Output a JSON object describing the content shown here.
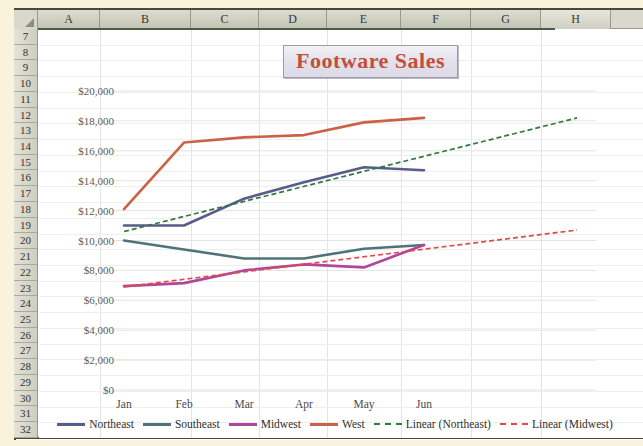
{
  "spreadsheet": {
    "columns": [
      "A",
      "B",
      "C",
      "D",
      "E",
      "F",
      "G",
      "H"
    ],
    "selected_columns": [
      "A",
      "B",
      "C",
      "D",
      "E",
      "F",
      "G"
    ],
    "rows": [
      "7",
      "8",
      "9",
      "10",
      "11",
      "12",
      "13",
      "14",
      "15",
      "16",
      "17",
      "18",
      "19",
      "20",
      "21",
      "22",
      "23",
      "24",
      "25",
      "26",
      "27",
      "28",
      "29",
      "30",
      "31",
      "32"
    ],
    "corner_icon": "select-all-triangle-icon"
  },
  "chart_data": {
    "type": "line",
    "title": "Footware Sales",
    "xlabel": "",
    "ylabel": "",
    "categories": [
      "Jan",
      "Feb",
      "Mar",
      "Apr",
      "May",
      "Jun"
    ],
    "ylim": [
      0,
      20000
    ],
    "ytick_step": 2000,
    "ytick_labels": [
      "$0",
      "$2,000",
      "$4,000",
      "$6,000",
      "$8,000",
      "$10,000",
      "$12,000",
      "$14,000",
      "$16,000",
      "$18,000",
      "$20,000"
    ],
    "grid": true,
    "legend_position": "bottom",
    "series": [
      {
        "name": "Northeast",
        "color": "#5b5b8a",
        "style": "solid",
        "values": [
          11000,
          11000,
          12800,
          13900,
          14900,
          14700
        ]
      },
      {
        "name": "Southeast",
        "color": "#4e7478",
        "style": "solid",
        "values": [
          10000,
          9400,
          8800,
          8800,
          9450,
          9700
        ]
      },
      {
        "name": "Midwest",
        "color": "#b0479a",
        "style": "solid",
        "values": [
          6950,
          7150,
          8000,
          8400,
          8200,
          9700
        ]
      },
      {
        "name": "West",
        "color": "#cb6248",
        "style": "solid",
        "values": [
          12100,
          16550,
          16900,
          17050,
          17900,
          18200
        ]
      },
      {
        "name": "Linear (Northeast)",
        "color": "#2f7a3e",
        "style": "dashed",
        "trend": true,
        "from": [
          0,
          10600
        ],
        "to": [
          7.55,
          18200
        ]
      },
      {
        "name": "Linear (Midwest)",
        "color": "#e04a4a",
        "style": "dashed",
        "trend": true,
        "from": [
          0,
          6900
        ],
        "to": [
          7.55,
          10700
        ]
      }
    ]
  },
  "colors": {
    "title_text": "#c0503a",
    "sheet_background": "#ffffff",
    "window_background": "#faf3dc",
    "header_fill": "#d8d8cc",
    "selection_bar": "#4b5d45"
  }
}
